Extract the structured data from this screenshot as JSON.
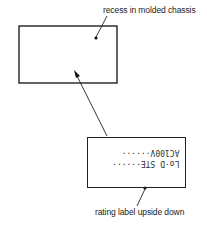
{
  "diagram": {
    "captions": {
      "recess": "recess in molded chassis",
      "rating": "rating label upside down"
    },
    "rating_label": {
      "line1": "Lo·D STE······",
      "line2": "AC100V······"
    },
    "colors": {
      "stroke": "#222222",
      "background": "#ffffff"
    }
  }
}
